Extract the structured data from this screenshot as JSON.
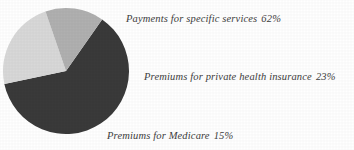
{
  "figure": {
    "background_color": "#ffffff",
    "label_text_color": "#3d3d3d"
  },
  "chart_data": {
    "type": "pie",
    "title": "",
    "subtitle": "",
    "xlabel": "",
    "ylabel": "",
    "grid": false,
    "legend_position": "callout-labels-right",
    "start_angle_deg": 35,
    "direction": "clockwise",
    "center": {
      "x": 66,
      "y": 71
    },
    "radius": 63,
    "categories": [
      "Payments for specific services",
      "Premiums for private health insurance",
      "Premiums for Medicare"
    ],
    "values": [
      62,
      23,
      15
    ],
    "value_suffix": "%",
    "colors": [
      "#3a3a3a",
      "#d8d8d8",
      "#b0b0b0"
    ],
    "slices": [
      {
        "name": "Payments for specific services",
        "value": 62,
        "value_label": "62%",
        "color": "#3a3a3a",
        "label_text": "Payments for specific services",
        "full_label": "Payments for specific services 62%"
      },
      {
        "name": "Premiums for private health insurance",
        "value": 23,
        "value_label": "23%",
        "color": "#d8d8d8",
        "label_text": "Premiums for private health insurance",
        "full_label": "Premiums for private health insurance 23%"
      },
      {
        "name": "Premiums for Medicare",
        "value": 15,
        "value_label": "15%",
        "color": "#b0b0b0",
        "label_text": "Premiums for Medicare",
        "full_label": "Premiums for Medicare 15%"
      }
    ]
  }
}
